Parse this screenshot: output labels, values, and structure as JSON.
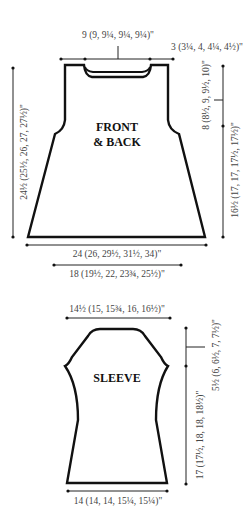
{
  "front_back": {
    "label_line1": "FRONT",
    "label_line2": "& BACK",
    "neck_width": "9 (9, 9¼, 9¼, 9¼)\"",
    "shoulder_width": "3 (3¼, 4, 4¼, 4½)\"",
    "total_length": "24½ (25½, 26, 27, 27½)\"",
    "armhole_depth": "8 (8½, 9, 9½, 10)\"",
    "side_length": "16½ (17, 17, 17½, 17½)\"",
    "hem_width": "24 (26, 29½, 31½, 34)\"",
    "chest_width": "18 (19½, 22, 23¾, 25½)\""
  },
  "sleeve": {
    "label": "SLEEVE",
    "top_width": "14½ (15, 15¾, 16, 16½)\"",
    "cap_depth": "5½ (6, 6½, 7, 7½)\"",
    "length": "17 (17½, 18, 18, 18½)\"",
    "cuff_width": "14 (14, 14, 15¼, 15¼)\""
  },
  "colors": {
    "outline": "#111111",
    "text": "#444444",
    "background": "#ffffff"
  }
}
